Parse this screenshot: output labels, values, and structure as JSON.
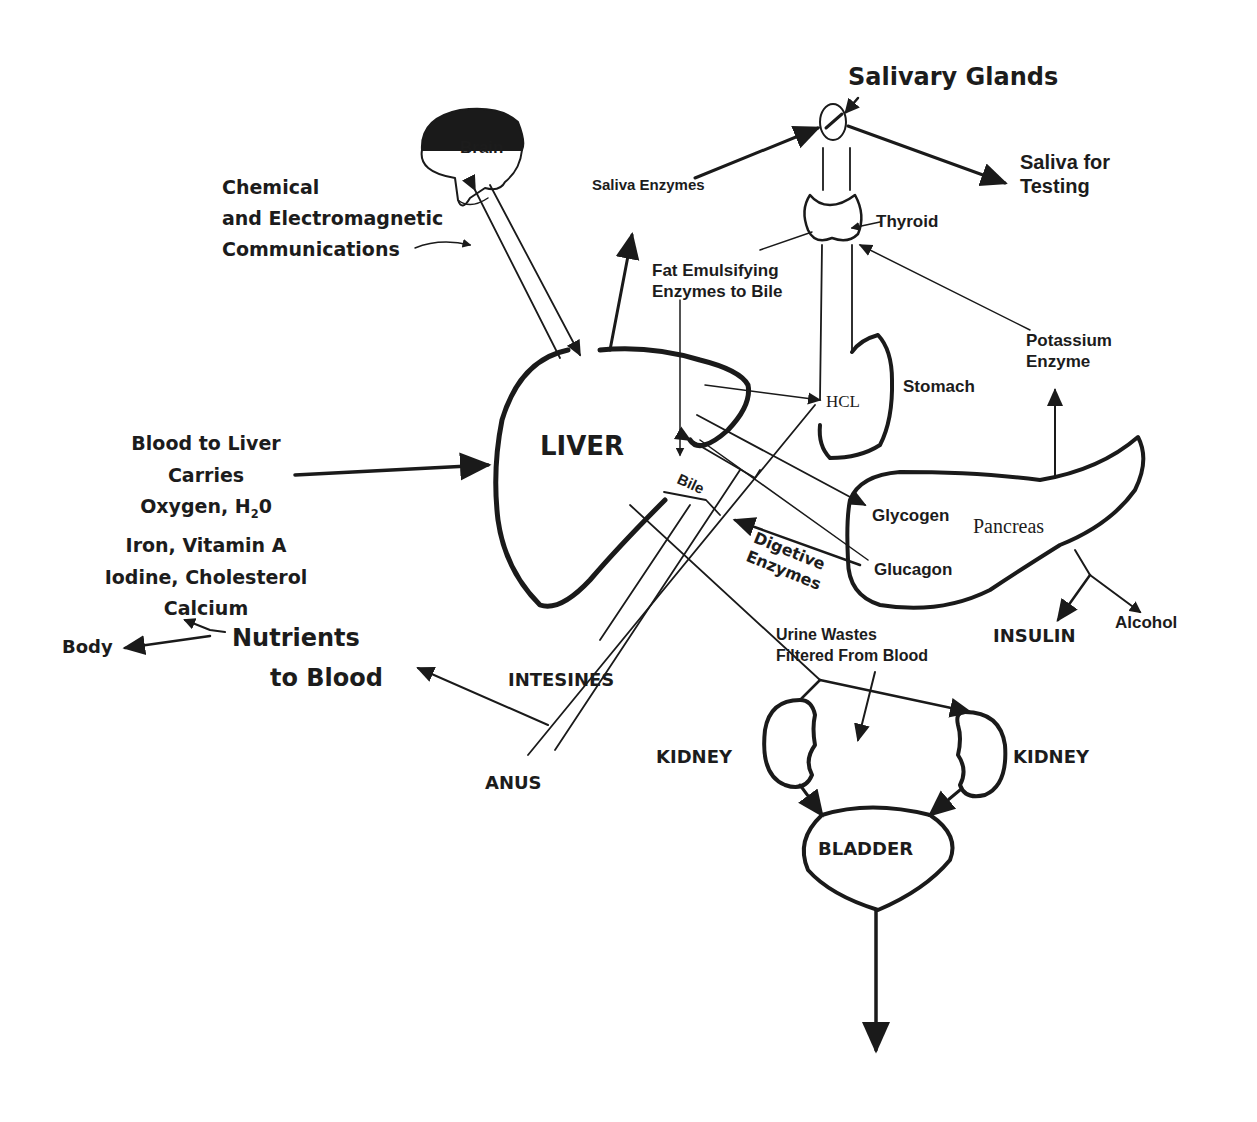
{
  "diagram": {
    "colors": {
      "ink": "#1a1a1a",
      "background": "#ffffff"
    },
    "organs": {
      "brain": "Brain",
      "salivary_glands": "Salivary Glands",
      "thyroid": "Thyroid",
      "stomach": "Stomach",
      "liver": "LIVER",
      "pancreas": "Pancreas",
      "intestines": "INTESINES",
      "anus": "ANUS",
      "kidney_left": "KIDNEY",
      "kidney_right": "KIDNEY",
      "bladder": "BLADDER"
    },
    "labels": {
      "communications": [
        "Chemical",
        "and Electromagnetic",
        "Communications"
      ],
      "saliva_enzymes": "Saliva Enzymes",
      "saliva_testing": [
        "Saliva for",
        "Testing"
      ],
      "fat_emulsifying": [
        "Fat Emulsifying",
        "Enzymes to Bile"
      ],
      "potassium": [
        "Potassium",
        "Enzyme"
      ],
      "hcl": "HCL",
      "bile": "Bile",
      "glycogen": "Glycogen",
      "glucagon": "Glucagon",
      "digestive_enzymes": [
        "Digetive",
        "Enzymes"
      ],
      "insulin": "INSULIN",
      "alcohol": "Alcohol",
      "urine_wastes": [
        "Urine Wastes",
        "Filtered From Blood"
      ],
      "blood_to_liver": {
        "line1": "Blood to Liver",
        "line2": "Carries",
        "line3_pre": "Oxygen, H",
        "line3_sub": "2",
        "line3_post": "0",
        "line4": "Iron, Vitamin A",
        "line5": "Iodine, Cholesterol",
        "line6": "Calcium"
      },
      "body": "Body",
      "nutrients": [
        "Nutrients",
        "to Blood"
      ]
    }
  }
}
